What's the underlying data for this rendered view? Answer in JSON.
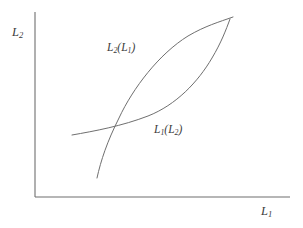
{
  "figure": {
    "background_color": "#ffffff",
    "line_color": "#6f6f6f",
    "axis_color": "#6f6f6f",
    "text_color": "#3b3b3b",
    "width": 303,
    "height": 228
  },
  "axes": {
    "y_label": "L",
    "y_label_sub": "2",
    "x_label": "L",
    "x_label_sub": "1",
    "origin": {
      "x": 35,
      "y": 197
    },
    "y_top": 12,
    "x_right": 290
  },
  "curves": [
    {
      "name": "L2(L1)",
      "label_main": "L",
      "label_sub": "2",
      "label_arg_open": "(",
      "label_arg_main": "L",
      "label_arg_sub": "1",
      "label_arg_close": ")",
      "description": "convex-increasing best-response curve, steep at left, flattening to the upper right",
      "path": "M 97,178 C 101,160 107,142 119,118 C 133,88 159,54 188,36 C 205,26 219,22 233,17",
      "label_position": {
        "x": 107,
        "y": 42
      }
    },
    {
      "name": "L1(L2)",
      "label_main": "L",
      "label_sub": "1",
      "label_arg_open": "(",
      "label_arg_main": "L",
      "label_arg_sub": "2",
      "label_arg_close": ")",
      "description": "flat at the left, rising gently then steeply to the upper right",
      "path": "M 72,135 C 95,131 122,126 148,116 C 176,105 198,82 212,58 C 221,43 226,30 230,19",
      "label_position": {
        "x": 154,
        "y": 124
      }
    }
  ],
  "intersections": [
    {
      "label": "lower-left crossing",
      "x": 105,
      "y": 134
    },
    {
      "label": "upper-right crossing",
      "x": 229,
      "y": 21
    }
  ]
}
